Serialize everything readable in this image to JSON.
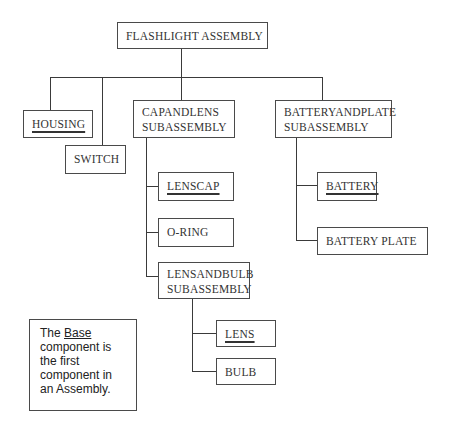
{
  "diagram": {
    "type": "assembly-hierarchy-tree",
    "root": {
      "label": "FLASHLIGHT ASSEMBLY",
      "children": [
        "housing",
        "switch",
        "capandlens",
        "batteryandplate"
      ]
    },
    "nodes": {
      "root": {
        "label": "FLASHLIGHT ASSEMBLY",
        "underlined": false
      },
      "housing": {
        "label": "HOUSING",
        "underlined": true
      },
      "switch": {
        "label": "SWITCH",
        "underlined": false
      },
      "capandlens": {
        "line1": "CAPANDLENS",
        "line2": "SUBASSEMBLY",
        "underlined": false
      },
      "lenscap": {
        "label": "LENSCAP",
        "underlined": true
      },
      "oring": {
        "label": "O-RING",
        "underlined": false
      },
      "lensandbulb": {
        "line1": "LENSANDBULB",
        "line2": "SUBASSEMBLY",
        "underlined": false
      },
      "lens": {
        "label": "LENS",
        "underlined": true
      },
      "bulb": {
        "label": "BULB",
        "underlined": false
      },
      "batteryandplate": {
        "line1": "BATTERYANDPLATE",
        "line2": "SUBASSEMBLY",
        "underlined": false
      },
      "battery": {
        "label": "BATTERY",
        "underlined": true
      },
      "batteryplate": {
        "label": "BATTERY PLATE",
        "underlined": false
      }
    },
    "hierarchy": {
      "FLASHLIGHT ASSEMBLY": [
        "HOUSING",
        "SWITCH",
        "CAPANDLENS SUBASSEMBLY",
        "BATTERYANDPLATE SUBASSEMBLY"
      ],
      "CAPANDLENS SUBASSEMBLY": [
        "LENSCAP",
        "O-RING",
        "LENSANDBULB SUBASSEMBLY"
      ],
      "LENSANDBULB SUBASSEMBLY": [
        "LENS",
        "BULB"
      ],
      "BATTERYANDPLATE SUBASSEMBLY": [
        "BATTERY",
        "BATTERY PLATE"
      ]
    }
  },
  "note": {
    "prefix": "The ",
    "emphasis": "Base",
    "line1_suffix": "",
    "line2": "component is",
    "line3": "the first",
    "line4": "component in",
    "line5": "an Assembly."
  },
  "colors": {
    "line": "#3a3a3a",
    "border": "#4a4a4a",
    "text": "#333333",
    "background": "#ffffff"
  }
}
